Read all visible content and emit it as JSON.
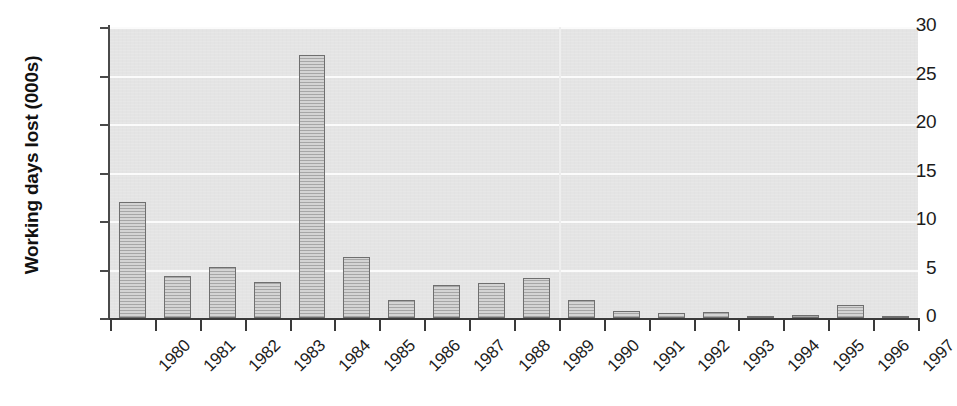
{
  "chart_data": {
    "type": "bar",
    "title": "",
    "subtitle": "",
    "xlabel": "",
    "ylabel": "Working days lost (000s)",
    "categories": [
      "1980",
      "1981",
      "1982",
      "1983",
      "1984",
      "1985",
      "1986",
      "1987",
      "1988",
      "1989",
      "1990",
      "1991",
      "1992",
      "1993",
      "1994",
      "1995",
      "1996",
      "1997"
    ],
    "values": [
      12.0,
      4.3,
      5.3,
      3.7,
      27.1,
      6.3,
      1.85,
      3.4,
      3.6,
      4.1,
      1.9,
      0.7,
      0.5,
      0.6,
      0.2,
      0.35,
      1.3,
      0.15
    ],
    "ylim": [
      0,
      30
    ],
    "yticks": [
      0,
      5,
      10,
      15,
      20,
      25,
      30
    ],
    "ytick_labels": [
      "0",
      "5",
      "10",
      "15",
      "20",
      "25",
      "30"
    ],
    "grid": "horizontal",
    "legend": "none",
    "series_name": "Working days lost (000s)",
    "colors": {
      "bar_fill": "#c2c2c2",
      "bar_border": "#6f6f6f",
      "plot_background": "#e4e4e4",
      "gridline": "#fbfbfb",
      "axis": "#3a3a3a",
      "text": "#1c1c1c",
      "page_background": "#ffffff"
    }
  }
}
